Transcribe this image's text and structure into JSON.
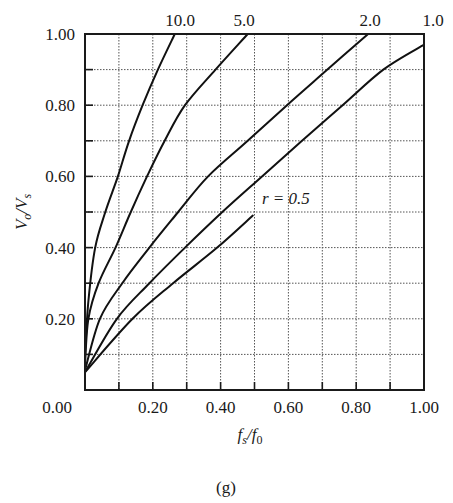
{
  "chart_data": {
    "type": "line",
    "title": "",
    "caption": "(g)",
    "xlabel": "f_s/f_0",
    "ylabel": "V_o/V_s",
    "xlim": [
      0,
      1.0
    ],
    "ylim": [
      0,
      1.0
    ],
    "grid": true,
    "grid_style": "dotted",
    "x_ticks": [
      0.0,
      0.1,
      0.2,
      0.3,
      0.4,
      0.5,
      0.6,
      0.7,
      0.8,
      0.9,
      1.0
    ],
    "x_tick_labels": [
      "0.00",
      "0.20",
      "0.40",
      "0.60",
      "0.80",
      "1.00"
    ],
    "x_tick_label_values": [
      0.0,
      0.2,
      0.4,
      0.6,
      0.8,
      1.0
    ],
    "y_ticks": [
      0.0,
      0.1,
      0.2,
      0.3,
      0.4,
      0.5,
      0.6,
      0.7,
      0.8,
      0.9,
      1.0
    ],
    "y_tick_labels": [
      "0.00",
      "0.20",
      "0.40",
      "0.60",
      "0.80",
      "1.00"
    ],
    "y_tick_label_values": [
      0.0,
      0.2,
      0.4,
      0.6,
      0.8,
      1.0
    ],
    "legend_position": "curve labels at top edge",
    "series": [
      {
        "name": "r = 10.0",
        "label": "10.0",
        "x": [
          0.0,
          0.01,
          0.03,
          0.06,
          0.097,
          0.13,
          0.17,
          0.215,
          0.265
        ],
        "y": [
          0.1,
          0.25,
          0.4,
          0.5,
          0.6,
          0.7,
          0.8,
          0.9,
          1.0
        ]
      },
      {
        "name": "r = 5.0",
        "label": "5.0",
        "x": [
          0.0,
          0.01,
          0.04,
          0.09,
          0.135,
          0.183,
          0.235,
          0.295,
          0.385,
          0.48
        ],
        "y": [
          0.07,
          0.2,
          0.3,
          0.4,
          0.5,
          0.6,
          0.7,
          0.8,
          0.9,
          1.0
        ]
      },
      {
        "name": "r = 2.0",
        "label": "2.0",
        "x": [
          0.0,
          0.044,
          0.11,
          0.19,
          0.275,
          0.363,
          0.48,
          0.596,
          0.715,
          0.835
        ],
        "y": [
          0.055,
          0.2,
          0.3,
          0.4,
          0.5,
          0.6,
          0.7,
          0.8,
          0.9,
          1.0
        ]
      },
      {
        "name": "r = 1.0",
        "label": "1.0",
        "x": [
          0.0,
          0.094,
          0.19,
          0.295,
          0.405,
          0.522,
          0.64,
          0.76,
          0.88,
          1.0
        ],
        "y": [
          0.05,
          0.2,
          0.3,
          0.4,
          0.5,
          0.6,
          0.7,
          0.8,
          0.9,
          0.97
        ]
      },
      {
        "name": "r = 0.5",
        "label": "r = 0.5",
        "x": [
          0.0,
          0.14,
          0.26,
          0.39,
          0.495
        ],
        "y": [
          0.05,
          0.2,
          0.3,
          0.4,
          0.49
        ]
      }
    ],
    "annotations": [
      {
        "text": "r = 0.5",
        "x": 0.52,
        "y": 0.54
      }
    ]
  },
  "labels": {
    "top": [
      "10.0",
      "5.0",
      "2.0",
      "1.0"
    ],
    "annotation": "r = 0.5",
    "caption": "(g)",
    "xlabel_main": "f",
    "xlabel_sub1": "s",
    "xlabel_sep": "/",
    "xlabel_main2": "f",
    "xlabel_sub2": "0",
    "ylabel_main": "V",
    "ylabel_sub1": "o",
    "ylabel_sep": "/",
    "ylabel_main2": "V",
    "ylabel_sub2": "s"
  }
}
